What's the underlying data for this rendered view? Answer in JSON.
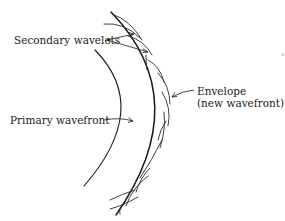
{
  "figure": {
    "labels": {
      "secondary_wavelets": "Secondary wavelets",
      "envelope_line1": "Envelope",
      "envelope_line2": "(new wavefront)",
      "primary_wavefront": "Primary wavefront"
    },
    "elements": [
      {
        "id": "primary-wavefront",
        "type": "arc",
        "description": "inner circular arc"
      },
      {
        "id": "envelope",
        "type": "arc",
        "description": "outer circular arc tangent to wavelets"
      },
      {
        "id": "secondary-wavelets",
        "type": "arc-set",
        "count": 12,
        "description": "small arcs centered on primary wavefront"
      }
    ],
    "colors": {
      "ink": "#1a1a1a",
      "background": "#ffffff"
    }
  }
}
